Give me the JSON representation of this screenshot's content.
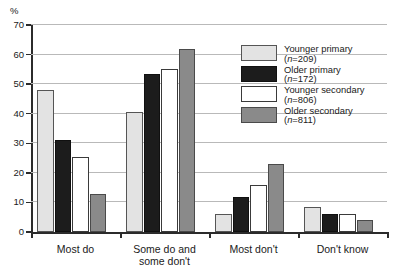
{
  "chart_data": {
    "type": "bar",
    "title": "",
    "xlabel": "",
    "ylabel": "%",
    "ylim": [
      0,
      70
    ],
    "yticks": [
      0,
      10,
      20,
      30,
      40,
      50,
      60,
      70
    ],
    "grid": true,
    "legend_position": "top-right",
    "categories": [
      "Most do",
      "Some do and\nsome don't",
      "Most don't",
      "Don't know"
    ],
    "series": [
      {
        "name": "Younger primary",
        "n": 209,
        "color": "#e3e3e3",
        "values": [
          48,
          40.5,
          6,
          8.5
        ]
      },
      {
        "name": "Older primary",
        "n": 172,
        "color": "#1c1c1c",
        "values": [
          31,
          53.5,
          12,
          6
        ]
      },
      {
        "name": "Younger secondary",
        "n": 806,
        "color": "#ffffff",
        "values": [
          25.5,
          55,
          16,
          6
        ]
      },
      {
        "name": "Older secondary",
        "n": 811,
        "color": "#8a8a8a",
        "values": [
          13,
          62,
          23,
          4
        ]
      }
    ]
  },
  "axis": {
    "y_title": "%",
    "y_labels": [
      "70",
      "60",
      "50",
      "40",
      "30",
      "20",
      "10",
      "0"
    ],
    "x_labels": [
      "Most do",
      "Some do and",
      "some don't",
      "Most don't",
      "Don't know"
    ]
  },
  "legend": {
    "items": [
      {
        "label": "Younger primary",
        "n": "(n=209)"
      },
      {
        "label": "Older primary",
        "n": "(n=172)"
      },
      {
        "label": "Younger secondary",
        "n": "(n=806)"
      },
      {
        "label": "Older secondary",
        "n": "(n=811)"
      }
    ]
  }
}
